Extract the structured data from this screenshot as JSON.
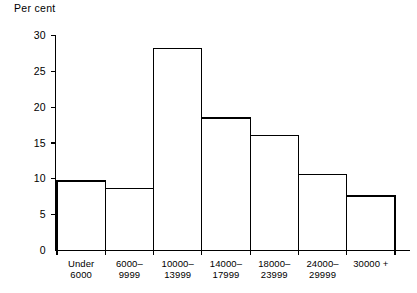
{
  "chart_data": {
    "type": "bar",
    "title": "",
    "subtitle": "",
    "xlabel": "",
    "ylabel": "Per cent",
    "categories": [
      "Under 6000",
      "6000–9999",
      "10000–13999",
      "14000–17999",
      "18000–23999",
      "24000–29999",
      "30000 +"
    ],
    "category_lines": [
      [
        "Under",
        "6000"
      ],
      [
        "6000–",
        "9999"
      ],
      [
        "10000–",
        "13999"
      ],
      [
        "14000–",
        "17999"
      ],
      [
        "18000–",
        "23999"
      ],
      [
        "24000–",
        "29999"
      ],
      [
        "30000 +",
        ""
      ]
    ],
    "values": [
      9.7,
      8.6,
      28.2,
      18.5,
      16.0,
      10.6,
      7.6
    ],
    "ylim": [
      0,
      30
    ],
    "yticks": [
      0,
      5,
      10,
      15,
      20,
      25,
      30
    ],
    "ytick_labels": [
      "0",
      "5",
      "10",
      "15",
      "20",
      "25",
      "30"
    ],
    "grid": false,
    "legend": "none",
    "bar_fill": "#ffffff",
    "bar_stroke": "#000000",
    "axis_color": "#000000"
  }
}
